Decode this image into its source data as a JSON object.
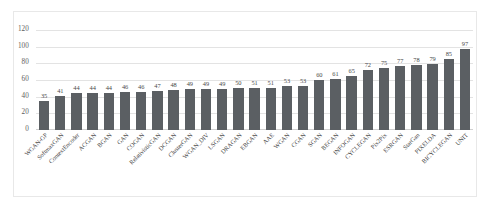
{
  "chart_data": {
    "type": "bar",
    "title": "",
    "subtitle": "",
    "xlabel": "",
    "ylabel": "",
    "ylim": [
      0,
      120
    ],
    "yticks": [
      0,
      20,
      40,
      60,
      80,
      100,
      120
    ],
    "grid": true,
    "legend": false,
    "legend_position": "none",
    "series_color": "#5b5f63",
    "categories": [
      "WGAN-GP",
      "SoftmaxGAN",
      "ContextEncoder",
      "ACGAN",
      "BGAN",
      "GAN",
      "COGAN",
      "RelativisticGAN",
      "DCGAN",
      "ClusterGAN",
      "WGAN_DIV",
      "LSGAN",
      "DRAGAN",
      "EBGAN",
      "AAE",
      "WGAN",
      "CGAN",
      "SGAN",
      "BEGAN",
      "INFOGAN",
      "CYCLEGAN",
      "Pix2Pix",
      "ESRGAN",
      "StarGan",
      "PIXELDA",
      "BICYCLEGAN",
      "UNIT"
    ],
    "values": [
      35,
      41,
      44,
      44,
      44,
      46,
      46,
      47,
      48,
      49,
      49,
      49,
      50,
      51,
      51,
      53,
      53,
      60,
      61,
      65,
      72,
      75,
      77,
      78,
      79,
      85,
      97
    ],
    "datalabels": [
      "35",
      "41",
      "44",
      "44",
      "44",
      "46",
      "46",
      "47",
      "48",
      "49",
      "49",
      "49",
      "50",
      "51",
      "51",
      "53",
      "53",
      "60",
      "61",
      "65",
      "72",
      "75",
      "77",
      "78",
      "79",
      "85",
      "97"
    ]
  },
  "colors": {
    "bar": "#5b5f63",
    "gridline": "#e3e3e3",
    "axis_text": "#5d5d5d",
    "label_text": "#3f3f3f",
    "frame": "#e8e8e8",
    "background": "#ffffff"
  }
}
